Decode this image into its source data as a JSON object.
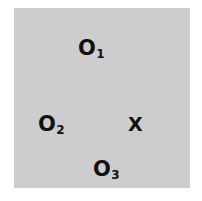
{
  "diagram": {
    "background_color": "#cdcdcd",
    "text_color": "#111111",
    "points": [
      {
        "id": "o1",
        "letter": "O",
        "subscript": "1",
        "x": 78,
        "y": 38
      },
      {
        "id": "o2",
        "letter": "O",
        "subscript": "2",
        "x": 38,
        "y": 114
      },
      {
        "id": "o3",
        "letter": "O",
        "subscript": "3",
        "x": 93,
        "y": 159
      }
    ],
    "target": {
      "id": "x",
      "label": "X",
      "x": 128,
      "y": 115
    }
  }
}
